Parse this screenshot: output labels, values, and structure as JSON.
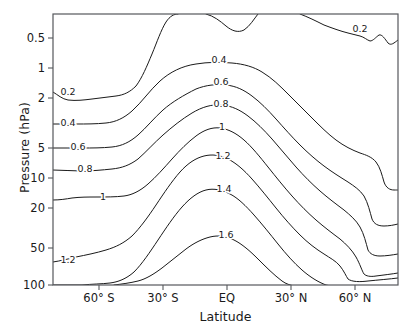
{
  "chart_data": {
    "type": "line",
    "subtype": "contour",
    "title": "",
    "xlabel": "Latitude",
    "ylabel": "Pressure (hPa)",
    "yscale": "log-inverted",
    "ylim": [
      0.35,
      100
    ],
    "xlim": [
      -90,
      90
    ],
    "grid": false,
    "legend": null,
    "y_ticks": [
      {
        "value": 0.5,
        "label": "0.5",
        "py": 38
      },
      {
        "value": 1,
        "label": "1",
        "py": 68
      },
      {
        "value": 2,
        "label": "2",
        "py": 98
      },
      {
        "value": 5,
        "label": "5",
        "py": 148
      },
      {
        "value": 10,
        "label": "10",
        "py": 178
      },
      {
        "value": 20,
        "label": "20",
        "py": 208
      },
      {
        "value": 50,
        "label": "50",
        "py": 248
      },
      {
        "value": 100,
        "label": "100",
        "py": 285
      }
    ],
    "x_ticks": [
      {
        "value": -60,
        "label": "60° S",
        "px": 99
      },
      {
        "value": -30,
        "label": "30° S",
        "px": 163
      },
      {
        "value": 0,
        "label": "EQ",
        "px": 227
      },
      {
        "value": 30,
        "label": "30° N",
        "px": 291
      },
      {
        "value": 60,
        "label": "60° N",
        "px": 355
      }
    ],
    "contour_levels": [
      0.2,
      0.4,
      0.6,
      0.8,
      1,
      1.2,
      1.4,
      1.6
    ],
    "contour_labels": [
      {
        "level": "0.2",
        "px": 68,
        "py": 95
      },
      {
        "level": "0.4",
        "px": 68,
        "py": 126
      },
      {
        "level": "0.6",
        "px": 78,
        "py": 150
      },
      {
        "level": "0.8",
        "px": 85,
        "py": 172
      },
      {
        "level": "1",
        "px": 103,
        "py": 200
      },
      {
        "level": "1.2",
        "px": 68,
        "py": 263
      },
      {
        "level": "0.4",
        "px": 219,
        "py": 63
      },
      {
        "level": "0.6",
        "px": 221,
        "py": 85
      },
      {
        "level": "0.8",
        "px": 221,
        "py": 107
      },
      {
        "level": "1",
        "px": 222,
        "py": 130
      },
      {
        "level": "1.2",
        "px": 223,
        "py": 159
      },
      {
        "level": "1.4",
        "px": 224,
        "py": 192
      },
      {
        "level": "1.6",
        "px": 226,
        "py": 238
      },
      {
        "level": "0.2",
        "px": 360,
        "py": 32
      }
    ],
    "contours": [
      {
        "level": "0.2-south",
        "d": "M 53,92 C 58,95 62,99 68,100 C 76,101 84,100 92,99 C 100,98 108,97 116,96 C 124,95 130,92 136,86 C 142,78 147,66 152,54 C 157,42 161,30 166,22 C 170,16 174,14 178,14"
      },
      {
        "level": "0.2-top-dip",
        "d": "M 206,14 C 214,16 220,21 226,26 C 232,31 238,33 244,30 C 250,26 254,19 258,14"
      },
      {
        "level": "0.2-north",
        "d": "M 300,14 C 308,17 316,21 324,25 C 332,28 340,31 348,33 C 352,34 356,35 360,36 C 364,37 367,40 370,41 C 373,41 376,37 379,35 C 382,34 385,39 388,43 C 391,46 394,43 398,40"
      },
      {
        "level": "0.4",
        "d": "M 53,124 C 60,124 68,124 76,124 C 86,124 96,124 106,123 C 116,122 124,118 132,111 C 142,102 150,90 160,81 C 170,72 182,66 196,64 C 208,62 220,62 232,63 C 244,64 254,67 262,72 C 272,78 280,86 288,94 C 296,102 304,110 312,118 C 320,126 328,134 336,140 C 344,146 352,150 360,153 C 366,155 372,157 376,162 C 380,167 382,175 384,182 C 386,188 390,190 394,190 C 396,190 397,190 398,190"
      },
      {
        "level": "0.6",
        "d": "M 53,148 C 62,148 72,148 82,148 C 92,148 102,148 112,147 C 122,146 130,142 138,135 C 146,128 154,118 163,110 C 172,102 184,95 196,89 C 206,85 216,84 226,85 C 236,86 244,90 252,96 C 260,102 268,110 276,119 C 284,128 292,137 300,145 C 308,153 316,160 324,166 C 332,172 340,177 348,182 C 354,186 360,190 364,196 C 368,203 370,212 372,219 C 374,224 378,226 384,226 C 389,226 394,225 398,224"
      },
      {
        "level": "0.8",
        "d": "M 53,170 C 62,170 72,171 82,171 C 92,171 102,170 112,169 C 122,168 130,165 138,159 C 146,152 154,143 163,135 C 172,127 182,119 192,113 C 202,107 212,104 222,105 C 232,106 240,110 248,116 C 256,122 264,130 272,139 C 280,148 288,158 296,167 C 304,176 312,184 320,191 C 328,198 336,204 344,210 C 350,215 356,220 360,227 C 364,234 366,243 368,250 C 370,254 374,256 380,256 C 386,256 392,255 398,254"
      },
      {
        "level": "1",
        "d": "M 53,200 C 60,200 66,199 72,198 C 80,197 88,197 96,197 C 106,197 116,197 124,196 C 132,195 140,191 148,184 C 156,177 164,168 172,159 C 180,150 188,142 196,136 C 204,130 212,127 220,128 C 228,129 236,133 244,140 C 252,147 260,157 268,167 C 276,177 284,187 292,196 C 300,205 308,213 316,220 C 324,227 332,233 340,239 C 346,244 352,250 356,257 C 360,264 362,271 364,274 C 366,276 370,277 376,276 C 384,275 392,274 398,273"
      },
      {
        "level": "1.2",
        "d": "M 53,262 C 60,261 68,259 76,257 C 86,255 96,253 106,250 C 116,247 124,243 132,236 C 140,228 148,217 156,205 C 164,193 172,181 180,172 C 188,163 196,158 204,156 C 212,154 220,155 228,159 C 236,163 244,170 252,179 C 260,188 268,198 276,208 C 284,218 292,227 300,235 C 308,243 316,249 324,254 C 330,258 336,261 340,266 C 344,271 346,276 348,279 C 352,282 360,282 368,281 C 378,280 390,279 398,278"
      },
      {
        "level": "1.4",
        "d": "M 53,285 C 62,285 72,285 82,285 C 92,284 102,284 110,283 C 118,282 126,279 134,272 C 142,264 150,252 158,240 C 166,228 174,216 182,207 C 190,198 198,192 206,190 C 214,188 222,190 230,194 C 238,198 246,206 254,215 C 262,224 270,234 278,244 C 286,254 294,263 302,270 C 310,277 318,282 326,285 C 330,286 334,286 338,286"
      },
      {
        "level": "1.6",
        "d": "M 114,285 C 122,284 130,283 138,281 C 146,279 154,274 162,268 C 170,262 178,255 186,249 C 194,243 202,239 210,237 C 218,235 226,236 234,240 C 242,244 250,251 258,259 C 266,267 274,275 282,281 C 286,284 290,285 294,286"
      }
    ]
  },
  "axes": {
    "x_title": "Latitude",
    "y_title": "Pressure (hPa)"
  },
  "colors": {
    "contour_stroke": "#1a1a1a",
    "frame_stroke": "#55585c",
    "background": "#ffffff",
    "text": "#1a1a1a"
  }
}
